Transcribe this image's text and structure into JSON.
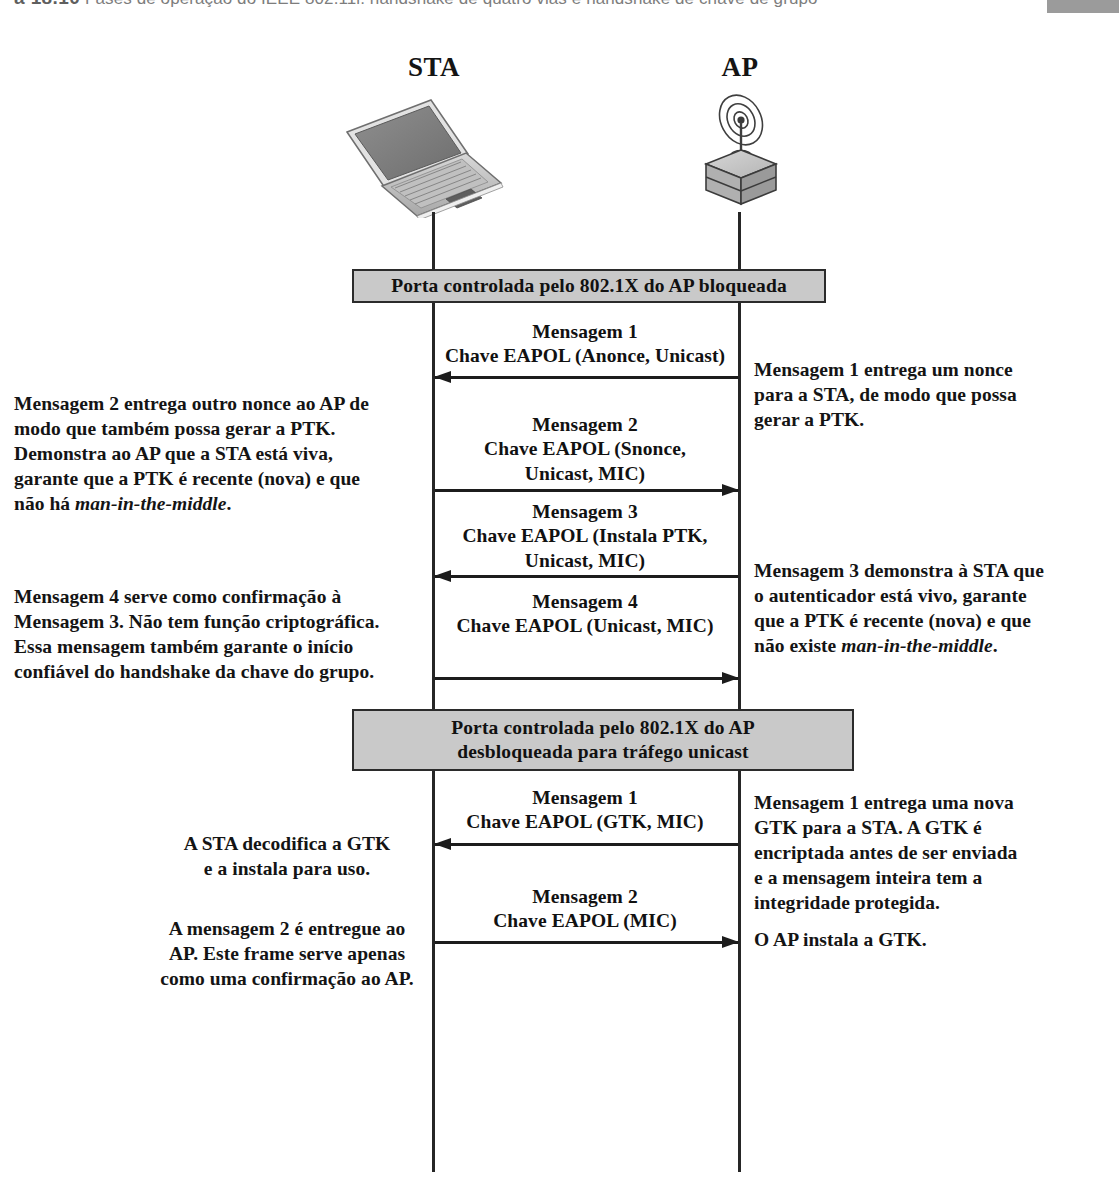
{
  "caption": {
    "figure_number": "a 18.10",
    "text": "Fases de operação do IEEE 802.11i: handshake de quatro vias e handshake de chave de grupo"
  },
  "endpoints": {
    "sta": {
      "label": "STA",
      "icon": "laptop-icon"
    },
    "ap": {
      "label": "AP",
      "icon": "access-point-antenna-icon"
    }
  },
  "phase_bars": {
    "blocked": {
      "line1": "Porta controlada pelo 802.1X do AP bloqueada"
    },
    "unblocked": {
      "line1": "Porta controlada pelo 802.1X do AP",
      "line2": "desbloqueada para tráfego unicast"
    }
  },
  "four_way_handshake": {
    "message1": {
      "title": "Mensagem 1",
      "body": "Chave EAPOL (Anonce, Unicast)",
      "direction": "ap-to-sta"
    },
    "message2": {
      "title": "Mensagem 2",
      "body_line1": "Chave EAPOL (Snonce,",
      "body_line2": "Unicast, MIC)",
      "direction": "sta-to-ap"
    },
    "message3": {
      "title": "Mensagem 3",
      "body_line1": "Chave EAPOL (Instala PTK,",
      "body_line2": "Unicast, MIC)",
      "direction": "ap-to-sta"
    },
    "message4": {
      "title": "Mensagem 4",
      "body": "Chave EAPOL (Unicast, MIC)",
      "direction": "sta-to-ap"
    }
  },
  "group_key_handshake": {
    "message1": {
      "title": "Mensagem 1",
      "body": "Chave EAPOL (GTK, MIC)",
      "direction": "ap-to-sta"
    },
    "message2": {
      "title": "Mensagem 2",
      "body": "Chave EAPOL (MIC)",
      "direction": "sta-to-ap"
    }
  },
  "annotations": {
    "msg2_left": {
      "line1": "Mensagem 2 entrega outro nonce ao AP de",
      "line2": "modo que também possa gerar a PTK.",
      "line3": "Demonstra ao AP que a STA está viva,",
      "line4": "garante que a PTK é recente (nova) e que",
      "line5_prefix": "não há ",
      "line5_italic": "man-in-the-middle",
      "line5_suffix": "."
    },
    "msg4_left": {
      "line1": "Mensagem 4 serve como confirmação à",
      "line2": "Mensagem 3. Não tem função criptográfica.",
      "line3": "Essa mensagem também garante o início",
      "line4": "confiável do handshake da chave do grupo."
    },
    "msg1_right": {
      "line1": "Mensagem 1 entrega um nonce",
      "line2": "para a STA, de modo que possa",
      "line3": "gerar a PTK."
    },
    "msg3_right": {
      "line1": "Mensagem 3 demonstra à STA que",
      "line2": "o autenticador está vivo, garante",
      "line3": "que a PTK é recente (nova) e que",
      "line4_prefix": "não existe ",
      "line4_italic": "man-in-the-middle",
      "line4_suffix": "."
    },
    "gtk_left": {
      "line1": "A STA decodifica a GTK",
      "line2": "e a instala para uso."
    },
    "gtk2_left": {
      "line1": "A mensagem 2 é entregue ao",
      "line2": "AP. Este frame serve apenas",
      "line3": "como uma confirmação ao AP."
    },
    "gtk_right": {
      "line1": "Mensagem 1 entrega uma nova",
      "line2": "GTK para a STA. A GTK é",
      "line3": "encriptada antes de ser enviada",
      "line4": "e a mensagem inteira tem a",
      "line5": "integridade protegida."
    },
    "gtk2_right": {
      "line1": "O AP instala a GTK."
    }
  },
  "colors": {
    "phase_bar_fill": "#c9c9c9",
    "line": "#1c1c1c",
    "text": "#141414"
  }
}
